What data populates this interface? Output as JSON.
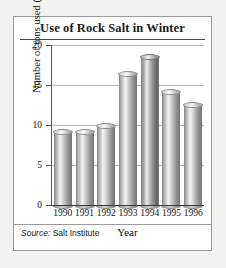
{
  "figure": {
    "title": "Use of Rock Salt in Winter",
    "source_label": "Source:",
    "source_text": " Salt Institute"
  },
  "chart_data": {
    "type": "bar",
    "title": "Use of Rock Salt in Winter",
    "xlabel": "Year",
    "ylabel": "Number of tons used (in millions)",
    "categories": [
      "1990",
      "1991",
      "1992",
      "1993",
      "1994",
      "1995",
      "1996"
    ],
    "values": [
      9.3,
      9.2,
      10.0,
      16.5,
      18.6,
      14.3,
      12.6
    ],
    "ylim": [
      0,
      20
    ],
    "yticks": [
      "0",
      "5",
      "10",
      "15",
      "20"
    ],
    "ytick_values": [
      0,
      5,
      10,
      15,
      20
    ],
    "grid": true,
    "legend": "none",
    "highlight_index": 4,
    "colors": {
      "bar_light": "#cfcfcf",
      "bar_dark": "#8e8e8e",
      "gridline": "#b6b6b6",
      "axis": "#3a3a3a",
      "panel_background": "#ffffff",
      "page_background": "#f2f2f0",
      "text": "#111111"
    }
  }
}
